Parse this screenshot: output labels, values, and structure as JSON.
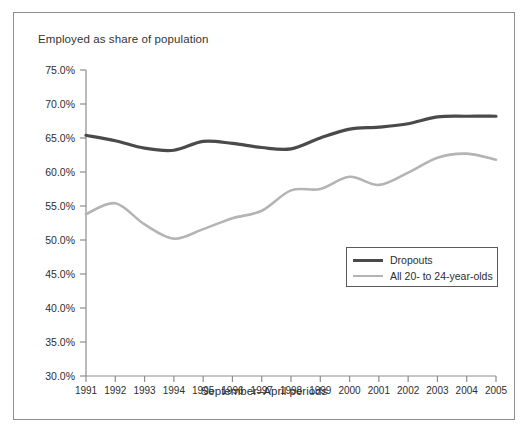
{
  "figure": {
    "title": "Employed as share of population",
    "xaxis_title": "September–April periods"
  },
  "legend": {
    "items": [
      {
        "label": "Dropouts",
        "color": "#4a4a4a",
        "style": "thick"
      },
      {
        "label": "All 20- to 24-year-olds",
        "color": "#b4b4b4",
        "style": "thin"
      }
    ]
  },
  "chart_data": {
    "type": "line",
    "title": "Employed as share of population",
    "subtitle": "",
    "xlabel": "September–April periods",
    "ylabel": "Employed as share of population",
    "grid": false,
    "legend_position": "inside-right-middle",
    "x": [
      1991,
      1992,
      1993,
      1994,
      1995,
      1996,
      1997,
      1998,
      1999,
      2000,
      2001,
      2002,
      2003,
      2004,
      2005
    ],
    "xticklabels": [
      "1991",
      "1992",
      "1993",
      "1994",
      "1995",
      "1996",
      "1997",
      "1998",
      "1999",
      "2000",
      "2001",
      "2002",
      "2003",
      "2004",
      "2005"
    ],
    "xlim": [
      1991,
      2005
    ],
    "ylim": [
      30.0,
      75.0
    ],
    "yticks": [
      30.0,
      35.0,
      40.0,
      45.0,
      50.0,
      55.0,
      60.0,
      65.0,
      70.0,
      75.0
    ],
    "yticklabels": [
      "30.0%",
      "35.0%",
      "40.0%",
      "45.0%",
      "50.0%",
      "55.0%",
      "60.0%",
      "65.0%",
      "70.0%",
      "75.0%"
    ],
    "series": [
      {
        "name": "Dropouts",
        "color": "#4a4a4a",
        "linewidth": 3.2,
        "values": [
          65.4,
          64.6,
          63.5,
          63.2,
          64.5,
          64.2,
          63.6,
          63.4,
          65.0,
          66.3,
          66.6,
          67.1,
          68.1,
          68.2,
          68.2
        ]
      },
      {
        "name": "All 20- to 24-year-olds",
        "color": "#b4b4b4",
        "linewidth": 2.6,
        "values": [
          53.8,
          55.4,
          52.3,
          50.2,
          51.6,
          53.2,
          54.3,
          57.3,
          57.5,
          59.3,
          58.1,
          59.9,
          62.1,
          62.7,
          61.8
        ]
      }
    ]
  }
}
